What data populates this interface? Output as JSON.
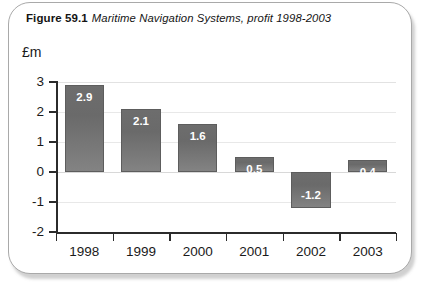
{
  "figure": {
    "number": "Figure 59.1",
    "caption": "Maritime Navigation Systems, profit 1998-2003"
  },
  "chart_data": {
    "type": "bar",
    "title": "Maritime Navigation Systems, profit 1998-2003",
    "xlabel": "",
    "ylabel": "£m",
    "unit_label": "£m",
    "categories": [
      "1998",
      "1999",
      "2000",
      "2001",
      "2002",
      "2003"
    ],
    "values": [
      2.9,
      2.1,
      1.6,
      0.5,
      -1.2,
      0.4
    ],
    "value_labels": [
      "2.9",
      "2.1",
      "1.6",
      "0.5",
      "-1.2",
      "0.4"
    ],
    "ylim": [
      -2,
      3
    ],
    "ytick_labels": [
      "3",
      "2",
      "1",
      "0",
      "-1",
      "-2"
    ],
    "ytick_values": [
      3,
      2,
      1,
      0,
      -1,
      -2
    ],
    "grid": true,
    "legend": false,
    "bar_color": "#6f6f6f",
    "label_color": "#ffffff"
  }
}
